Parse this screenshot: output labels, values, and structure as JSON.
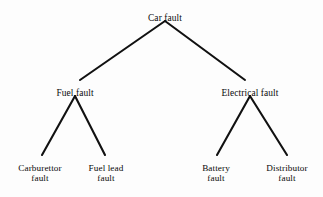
{
  "diagram": {
    "type": "fault-tree",
    "title_text": "Car fault",
    "background_color": "#fdfdfd",
    "edge_color": "#111111",
    "text_color": "#0a0a0a",
    "nodes": {
      "root": {
        "label": "Car fault",
        "line1": "Car fault",
        "line2": "",
        "x": 165,
        "y": 13,
        "level": 0
      },
      "fuel": {
        "label": "Fuel fault",
        "line1": "Fuel fault",
        "line2": "",
        "x": 75,
        "y": 88,
        "level": 1
      },
      "electrical": {
        "label": "Electrical fault",
        "line1": "Electrical fault",
        "line2": "",
        "x": 250,
        "y": 88,
        "level": 1
      },
      "carburettor": {
        "label": "Carburettor fault",
        "line1": "Carburettor",
        "line2": "fault",
        "x": 40,
        "y": 163,
        "level": 2
      },
      "fuel_lead": {
        "label": "Fuel lead fault",
        "line1": "Fuel lead",
        "line2": "fault",
        "x": 106,
        "y": 163,
        "level": 2
      },
      "battery": {
        "label": "Battery fault",
        "line1": "Battery",
        "line2": "fault",
        "x": 216,
        "y": 163,
        "level": 2
      },
      "distributor": {
        "label": "Distributor fault",
        "line1": "Distributor",
        "line2": "fault",
        "x": 287,
        "y": 163,
        "level": 2
      }
    },
    "edges": [
      {
        "from": "root",
        "to": "fuel",
        "x1": 165,
        "y1": 21,
        "x2": 80,
        "y2": 80
      },
      {
        "from": "root",
        "to": "electrical",
        "x1": 165,
        "y1": 21,
        "x2": 245,
        "y2": 80
      },
      {
        "from": "fuel",
        "to": "carburettor",
        "x1": 75,
        "y1": 96,
        "x2": 42,
        "y2": 155
      },
      {
        "from": "fuel",
        "to": "fuel_lead",
        "x1": 75,
        "y1": 96,
        "x2": 105,
        "y2": 155
      },
      {
        "from": "electrical",
        "to": "battery",
        "x1": 250,
        "y1": 96,
        "x2": 217,
        "y2": 155
      },
      {
        "from": "electrical",
        "to": "distributor",
        "x1": 250,
        "y1": 96,
        "x2": 287,
        "y2": 155
      }
    ]
  }
}
